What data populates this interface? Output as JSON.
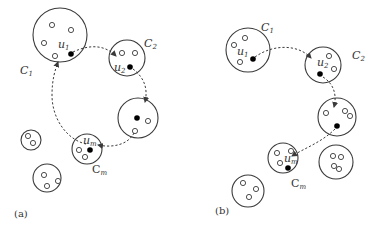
{
  "figure": {
    "panels": [
      {
        "id": "a",
        "caption": "(a)",
        "path_type": "closed-cycle",
        "clusters": [
          {
            "name": "C",
            "sub": "1",
            "leader": "u",
            "leader_sub": "1"
          },
          {
            "name": "C",
            "sub": "2",
            "leader": "u",
            "leader_sub": "2"
          },
          {
            "name": "",
            "sub": "",
            "leader": "",
            "leader_sub": ""
          },
          {
            "name": "C",
            "sub": "m",
            "leader": "u",
            "leader_sub": "m"
          }
        ],
        "other_clusters": 2
      },
      {
        "id": "b",
        "caption": "(b)",
        "path_type": "open-chain",
        "clusters": [
          {
            "name": "C",
            "sub": "1",
            "leader": "u",
            "leader_sub": "1"
          },
          {
            "name": "C",
            "sub": "2",
            "leader": "u",
            "leader_sub": "2"
          },
          {
            "name": "",
            "sub": "",
            "leader": "",
            "leader_sub": ""
          },
          {
            "name": "C",
            "sub": "m",
            "leader": "u",
            "leader_sub": "m"
          }
        ],
        "other_clusters": 2
      }
    ]
  }
}
